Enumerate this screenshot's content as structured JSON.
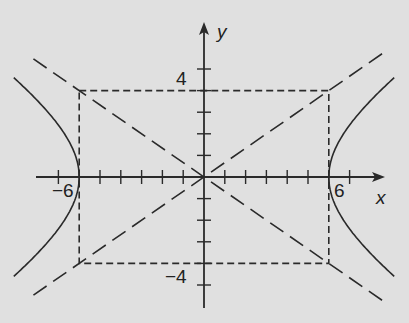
{
  "diagram": {
    "equation": "x^2/36 - y^2/16 = 1",
    "axes": {
      "x_label": "x",
      "y_label": "y",
      "x_tick_range": [
        -7,
        7
      ],
      "y_tick_range": [
        -5,
        5
      ]
    },
    "tick_labels": {
      "x_neg": "−6",
      "x_pos": "6",
      "y_pos": "4",
      "y_neg": "−4"
    },
    "vertices": [
      [
        -6,
        0
      ],
      [
        6,
        0
      ]
    ],
    "rectangle": {
      "x_min": -6,
      "x_max": 6,
      "y_min": -4,
      "y_max": 4,
      "style": "dashed"
    },
    "asymptotes": [
      {
        "slope": 0.6667,
        "style": "dashed"
      },
      {
        "slope": -0.6667,
        "style": "dashed"
      }
    ],
    "colors": {
      "background": "#e0e0e0",
      "ink": "#2a2a2a"
    }
  }
}
